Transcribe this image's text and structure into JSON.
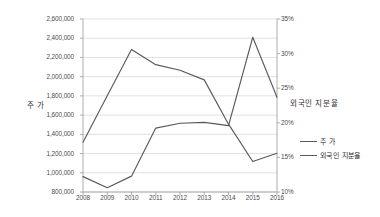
{
  "chart_data": {
    "type": "line",
    "title": "",
    "xlabel": "",
    "ylabel": "주 가",
    "y2label": "외국인 지분율",
    "grid": true,
    "legend_position": "right",
    "categories": [
      "2008",
      "2009",
      "2010",
      "2011",
      "2012",
      "2013",
      "2014",
      "2015",
      "2016"
    ],
    "x_tick_labels": [
      "2008",
      "2009",
      "2010",
      "2011",
      "2012",
      "2013",
      "2014",
      "2015",
      "2016"
    ],
    "ylim": [
      800000,
      2600000
    ],
    "y_tick_labels": [
      "800,000",
      "1,000,000",
      "1,200,000",
      "1,400,000",
      "1,600,000",
      "1,800,000",
      "2,000,000",
      "2,200,000",
      "2,400,000",
      "2,600,000"
    ],
    "y_ticks": [
      800000,
      1000000,
      1200000,
      1400000,
      1600000,
      1800000,
      2000000,
      2200000,
      2400000,
      2600000
    ],
    "y2lim": [
      10,
      35
    ],
    "y2_tick_labels": [
      "10%",
      "15%",
      "20%",
      "25%",
      "30%",
      "35%"
    ],
    "y2_ticks": [
      10,
      15,
      20,
      25,
      30,
      35
    ],
    "series": [
      {
        "name": "주 가",
        "axis": "left",
        "color": "#5a5a5a",
        "values": [
          960000,
          845000,
          965000,
          1465000,
          1515000,
          1525000,
          1490000,
          2410000,
          1785000
        ]
      },
      {
        "name": "외국인 지분율",
        "axis": "right",
        "color": "#5a5a5a",
        "values": [
          17.2,
          23.9,
          30.6,
          28.4,
          27.6,
          26.2,
          19.8,
          14.4,
          15.6
        ]
      }
    ]
  },
  "legend": {
    "items": [
      {
        "label": "주 가"
      },
      {
        "label": "외국인 지분율"
      }
    ]
  },
  "colors": {
    "series_line": "#5a5a5a",
    "gridline": "#d4d4d4",
    "axis": "#9a9a9a",
    "text": "#3a3a3a",
    "background": "#ffffff"
  }
}
